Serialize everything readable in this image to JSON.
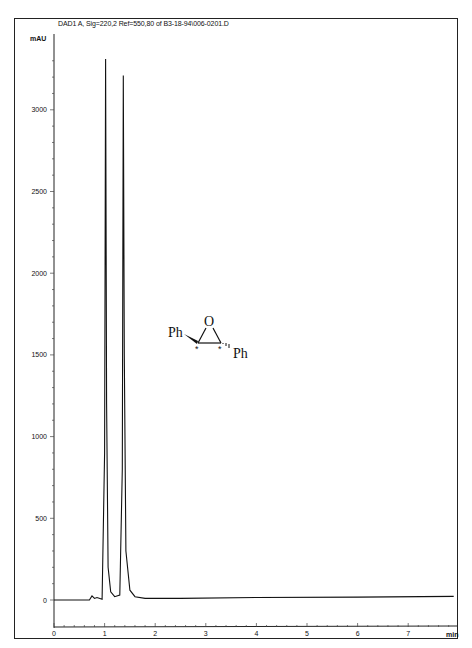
{
  "header": {
    "title": "DAD1 A, Sig=220,2 Ref=550,80 of B3-18-94\\006-0201.D"
  },
  "axes": {
    "y_unit": "mAU",
    "x_unit": "min",
    "y_ticks": [
      "0",
      "500",
      "1000",
      "1500",
      "2000",
      "2500",
      "3000"
    ],
    "x_ticks": [
      "0",
      "1",
      "2",
      "3",
      "4",
      "5",
      "6",
      "7"
    ]
  },
  "structure": {
    "left_substituent": "Ph",
    "right_substituent": "Ph",
    "ring_atom": "O",
    "stereo_marks": [
      "*",
      "*"
    ]
  },
  "chart_data": {
    "type": "line",
    "title": "DAD1 A, Sig=220,2 Ref=550,80 of B3-18-94\\006-0201.D",
    "xlabel": "min",
    "ylabel": "mAU",
    "xlim": [
      0,
      7.9
    ],
    "ylim": [
      -180,
      3400
    ],
    "grid": false,
    "legend": null,
    "annotations": [
      "Ph–epoxide–Ph (trans-stilbene oxide, stereocenters marked *)"
    ],
    "series": [
      {
        "name": "DAD1 A 220 nm",
        "x": [
          0,
          0.7,
          0.75,
          0.8,
          0.85,
          0.95,
          1.0,
          1.02,
          1.04,
          1.07,
          1.12,
          1.2,
          1.3,
          1.35,
          1.37,
          1.39,
          1.42,
          1.5,
          1.6,
          1.8,
          2.5,
          4.0,
          6.0,
          7.9
        ],
        "y": [
          0,
          0,
          25,
          10,
          15,
          5,
          900,
          3310,
          1200,
          200,
          50,
          20,
          30,
          800,
          3210,
          1500,
          300,
          60,
          20,
          10,
          10,
          15,
          18,
          22
        ]
      }
    ],
    "peaks": [
      {
        "retention_time_min": 1.02,
        "height_mAU": 3310
      },
      {
        "retention_time_min": 1.37,
        "height_mAU": 3210
      }
    ]
  }
}
